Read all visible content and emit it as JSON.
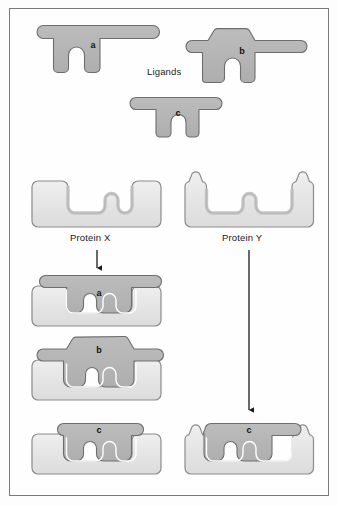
{
  "figure": {
    "background_color": "#fdfdfd",
    "border_color": "#7a7a7a"
  },
  "palette": {
    "ligand_fill": "#b4b4b4",
    "ligand_stroke": "#6e6e6e",
    "protein_fill": "#e2e2e2",
    "protein_stroke": "#8c8c8c",
    "protein_inner_shade": "#c2c2c2",
    "gap_color": "#ffffff",
    "arrow_color": "#1a1a1a",
    "text_color": "#1b1b1b"
  },
  "labels": {
    "ligands_heading": "Ligands",
    "protein_x": "Protein X",
    "protein_y": "Protein Y"
  },
  "ligands": [
    {
      "id": "a",
      "letter": "a",
      "description": "wide flat crossbar with two short straight prongs",
      "top_shape": "flat-bar",
      "binds_protein_x": true,
      "binds_protein_y": false
    },
    {
      "id": "b",
      "letter": "b",
      "description": "trapezoidal raised body with side wings and two prongs",
      "top_shape": "trapezoid",
      "binds_protein_x": true,
      "binds_protein_y": false
    },
    {
      "id": "c",
      "letter": "c",
      "description": "short flat crossbar with two prongs",
      "top_shape": "flat-bar",
      "binds_protein_x": true,
      "binds_protein_y": true
    }
  ],
  "proteins": [
    {
      "id": "x",
      "name": "Protein X",
      "description": "rounded block with one wide notch and one narrow notch, flat top edges"
    },
    {
      "id": "y",
      "name": "Protein Y",
      "description": "rounded block with one wide notch and one narrow notch, raised horns at both outer edges"
    }
  ],
  "complexes": [
    {
      "id": "x-a",
      "protein": "Protein X",
      "ligand": "a",
      "letter": "a"
    },
    {
      "id": "x-b",
      "protein": "Protein X",
      "ligand": "b",
      "letter": "b"
    },
    {
      "id": "x-c",
      "protein": "Protein X",
      "ligand": "c",
      "letter": "c"
    },
    {
      "id": "y-c",
      "protein": "Protein Y",
      "ligand": "c",
      "letter": "c"
    }
  ],
  "arrows": [
    {
      "id": "arrow-x",
      "from": "Protein X",
      "to": "Protein X complexes"
    },
    {
      "id": "arrow-y",
      "from": "Protein Y",
      "to": "Protein Y complex c"
    }
  ]
}
